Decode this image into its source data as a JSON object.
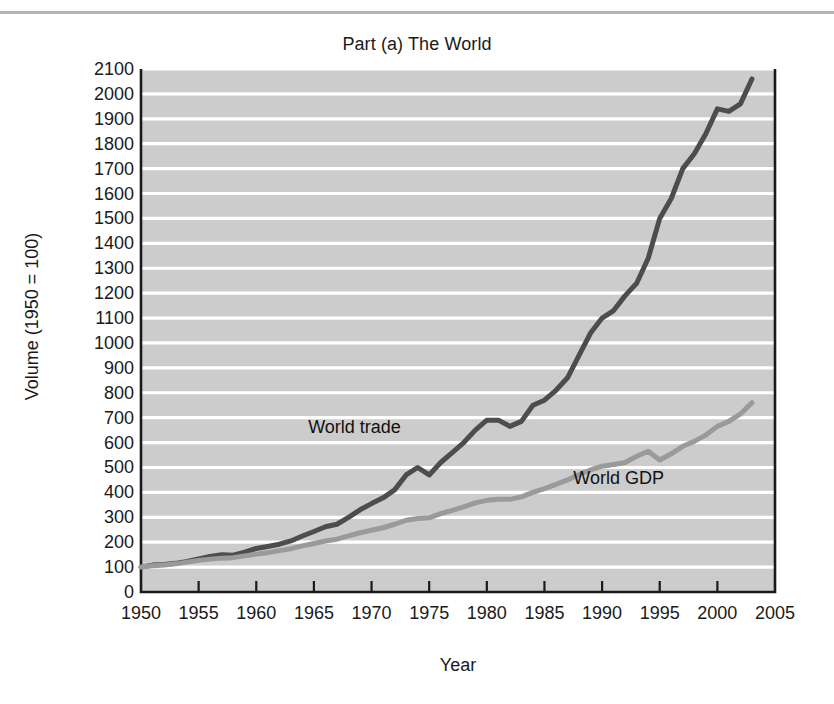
{
  "figure": {
    "title": "Part (a) The World",
    "xlabel": "Year",
    "ylabel": "Volume (1950 = 100)"
  },
  "style": {
    "plot_background": "#cccccc",
    "gridline_color": "#ffffff",
    "axis_color": "#1a1a1a",
    "trade_color": "#4d4d4d",
    "gdp_color": "#9a9a9a",
    "page_background": "#ffffff",
    "top_rule_color": "#b4b4b4"
  },
  "chart_data": {
    "type": "line",
    "title": "Part (a) The World",
    "xlabel": "Year",
    "ylabel": "Volume (1950 = 100)",
    "xlim": [
      1950,
      2005
    ],
    "ylim": [
      0,
      2100
    ],
    "grid": true,
    "legend_position": "inline-annotations",
    "xticks": [
      1950,
      1955,
      1960,
      1965,
      1970,
      1975,
      1980,
      1985,
      1990,
      1995,
      2000,
      2005
    ],
    "yticks": [
      0,
      100,
      200,
      300,
      400,
      500,
      600,
      700,
      800,
      900,
      1000,
      1100,
      1200,
      1300,
      1400,
      1500,
      1600,
      1700,
      1800,
      1900,
      2000,
      2100
    ],
    "x": [
      1950,
      1951,
      1952,
      1953,
      1954,
      1955,
      1956,
      1957,
      1958,
      1959,
      1960,
      1961,
      1962,
      1963,
      1964,
      1965,
      1966,
      1967,
      1968,
      1969,
      1970,
      1971,
      1972,
      1973,
      1974,
      1975,
      1976,
      1977,
      1978,
      1979,
      1980,
      1981,
      1982,
      1983,
      1984,
      1985,
      1986,
      1987,
      1988,
      1989,
      1990,
      1991,
      1992,
      1993,
      1994,
      1995,
      1996,
      1997,
      1998,
      1999,
      2000,
      2001,
      2002,
      2003
    ],
    "series": [
      {
        "name": "World trade",
        "color": "#4d4d4d",
        "label_x": 1964.5,
        "label_y": 660,
        "values": [
          100,
          108,
          110,
          115,
          123,
          133,
          143,
          150,
          148,
          160,
          175,
          183,
          192,
          205,
          225,
          243,
          262,
          272,
          300,
          330,
          355,
          378,
          410,
          470,
          500,
          470,
          520,
          560,
          600,
          650,
          690,
          690,
          665,
          685,
          750,
          770,
          810,
          860,
          950,
          1040,
          1100,
          1130,
          1190,
          1240,
          1340,
          1500,
          1580,
          1700,
          1760,
          1840,
          1940,
          1930,
          1960,
          2060
        ]
      },
      {
        "name": "World GDP",
        "color": "#9a9a9a",
        "label_x": 1987.5,
        "label_y": 455,
        "values": [
          100,
          105,
          108,
          113,
          120,
          127,
          132,
          136,
          138,
          145,
          152,
          158,
          166,
          174,
          185,
          195,
          205,
          212,
          225,
          238,
          248,
          258,
          272,
          288,
          295,
          298,
          315,
          328,
          342,
          358,
          368,
          372,
          372,
          382,
          400,
          415,
          432,
          450,
          472,
          490,
          505,
          512,
          520,
          545,
          565,
          530,
          555,
          585,
          605,
          630,
          665,
          685,
          715,
          760
        ]
      }
    ]
  }
}
